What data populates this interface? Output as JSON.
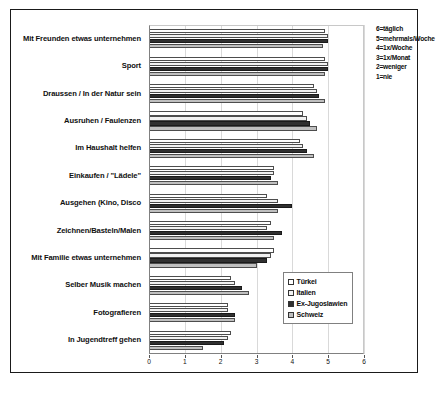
{
  "chart_data": {
    "type": "bar",
    "orientation": "horizontal",
    "title": "",
    "xlabel": "",
    "ylabel": "",
    "xlim": [
      0,
      6
    ],
    "xticks": [
      "0",
      "1",
      "2",
      "3",
      "4",
      "5",
      "6"
    ],
    "grid": true,
    "legend_position": "inside-bottom-right",
    "categories": [
      "Mit Freunden etwas unternehmen",
      "Sport",
      "Draussen / In der Natur sein",
      "Ausruhen / Faulenzen",
      "Im Haushalt helfen",
      "Einkaufen / \"Lädele\"",
      "Ausgehen (Kino, Disco",
      "Zeichnen/Basteln/Malen",
      "Mit Familie etwas unternehmen",
      "Selber Musik machen",
      "Fotografieren",
      "In Jugendtreff gehen"
    ],
    "series": [
      {
        "name": "Türkei",
        "values": [
          4.9,
          4.9,
          4.6,
          4.3,
          4.2,
          3.5,
          3.3,
          3.4,
          3.5,
          2.3,
          2.2,
          2.3
        ]
      },
      {
        "name": "Italien",
        "values": [
          5.0,
          5.0,
          4.7,
          4.4,
          4.3,
          3.5,
          3.6,
          3.3,
          3.4,
          2.4,
          2.2,
          2.2
        ]
      },
      {
        "name": "Ex-Jugoslawien",
        "values": [
          5.0,
          5.0,
          4.75,
          4.5,
          4.4,
          3.4,
          4.0,
          3.7,
          3.3,
          2.6,
          2.4,
          2.1
        ]
      },
      {
        "name": "Schweiz",
        "values": [
          4.85,
          4.9,
          4.9,
          4.7,
          4.6,
          3.6,
          3.6,
          3.5,
          3.0,
          2.8,
          2.4,
          1.5
        ]
      }
    ],
    "scale_legend": [
      "6=täglich",
      "5=mehrmals/Woche",
      "4=1x/Woche",
      "3=1x/Monat",
      "2=weniger",
      "1=nie"
    ],
    "series_colors": [
      "#ffffff",
      "#f2f2f2",
      "#303030",
      "#bfbfbf"
    ]
  }
}
